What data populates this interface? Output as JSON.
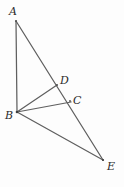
{
  "figure": {
    "background_color": "#fdfdfd",
    "stroke_color": "#595959",
    "label_color": "#2b2b2b",
    "width": 124,
    "height": 187,
    "points": {
      "A": {
        "label": "A",
        "x": 16,
        "y": 21
      },
      "B": {
        "label": "B",
        "x": 17,
        "y": 112
      },
      "C": {
        "label": "C",
        "x": 70,
        "y": 101
      },
      "D": {
        "label": "D",
        "x": 57,
        "y": 85
      },
      "E": {
        "label": "E",
        "x": 103,
        "y": 160
      }
    },
    "segments": [
      {
        "name": "segment-AB",
        "from": "A",
        "to": "B"
      },
      {
        "name": "segment-AE",
        "from": "A",
        "to": "E"
      },
      {
        "name": "segment-BD",
        "from": "B",
        "to": "D"
      },
      {
        "name": "segment-BC",
        "from": "B",
        "to": "C"
      },
      {
        "name": "segment-BE",
        "from": "B",
        "to": "E"
      }
    ],
    "collinear_note": "A, D, C, E lie on one straight line"
  }
}
